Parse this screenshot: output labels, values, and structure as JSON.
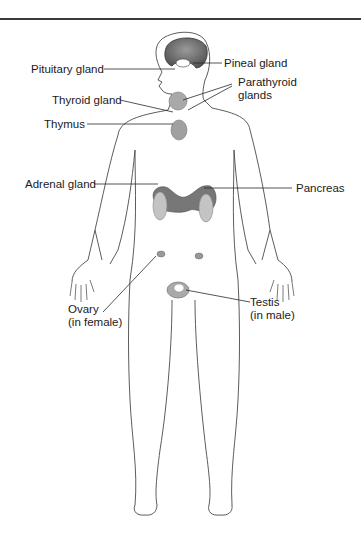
{
  "diagram": {
    "type": "anatomical-illustration",
    "labels": {
      "pituitary": "Pituitary gland",
      "pineal": "Pineal gland",
      "parathyroid_1": "Parathyroid",
      "parathyroid_2": "glands",
      "thyroid": "Thyroid gland",
      "thymus": "Thymus",
      "adrenal": "Adrenal gland",
      "pancreas": "Pancreas",
      "ovary_1": "Ovary",
      "ovary_2": "(in female)",
      "testis_1": "Testis",
      "testis_2": "(in male)"
    },
    "colors": {
      "brain": "#6a6a6a",
      "gland_dark": "#555555",
      "gland_light": "#bdbdbd",
      "outline": "#4a4a4a",
      "leader": "#2a2a2a"
    }
  }
}
